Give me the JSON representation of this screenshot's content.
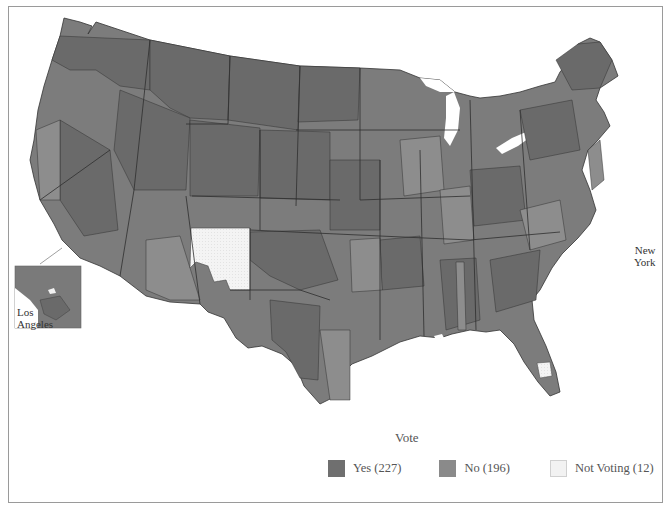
{
  "map": {
    "subject": "U.S. House roll-call vote by congressional district",
    "regions_shown": [
      "Contiguous United States",
      "Alaska",
      "Hawaii"
    ],
    "insets": [
      {
        "name": "Los Angeles",
        "label_line1": "Los",
        "label_line2": "Angeles"
      },
      {
        "name": "New York",
        "label_line1": "New",
        "label_line2": "York"
      }
    ]
  },
  "legend": {
    "title": "Vote",
    "items": [
      {
        "key": "yes",
        "label": "Yes (227)",
        "count": 227,
        "color": "#6f6f6f"
      },
      {
        "key": "no",
        "label": "No (196)",
        "count": 196,
        "color": "#8a8a8a"
      },
      {
        "key": "not_voting",
        "label": "Not Voting (12)",
        "count": 12,
        "color": "#f2f2f2"
      }
    ]
  },
  "colors": {
    "yes": "#6f6f6f",
    "no": "#8a8a8a",
    "not_voting": "#f2f2f2",
    "border": "#3a3a3a",
    "frame": "#9a9a9a"
  }
}
